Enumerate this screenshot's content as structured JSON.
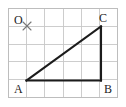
{
  "figure": {
    "type": "geometry-diagram",
    "canvas": {
      "width": 126,
      "height": 107,
      "background": "#ffffff"
    },
    "grid": {
      "left": 8.5,
      "top": 8.5,
      "right": 117.5,
      "bottom": 97.5,
      "columns": 6,
      "rows": 5,
      "cell_width": 18.2,
      "cell_height": 17.8,
      "line_color": "#c8c8c8",
      "border_color": "#bdbdbd",
      "visible": true
    },
    "origin": {
      "label": "O",
      "label_x": 14,
      "label_y": 14,
      "marker": "x-cross",
      "marker_x": 27,
      "marker_y": 26,
      "marker_size": 4,
      "marker_color": "#777777"
    },
    "shape": {
      "name": "triangle-abc",
      "stroke_color": "#1c1c1c",
      "stroke_width": 2.1,
      "right_angle_at": "B",
      "points": [
        {
          "name": "A",
          "x": 26.5,
          "y": 80.5,
          "label": "A",
          "label_x": 14,
          "label_y": 83
        },
        {
          "name": "B",
          "x": 101.0,
          "y": 80.5,
          "label": "B",
          "label_x": 104,
          "label_y": 83
        },
        {
          "name": "C",
          "x": 101.0,
          "y": 26.5,
          "label": "C",
          "label_x": 99,
          "label_y": 12
        }
      ],
      "sides": [
        {
          "name": "AB",
          "from": "A",
          "to": "B"
        },
        {
          "name": "BC",
          "from": "B",
          "to": "C"
        },
        {
          "name": "CA",
          "from": "C",
          "to": "A"
        }
      ]
    }
  }
}
